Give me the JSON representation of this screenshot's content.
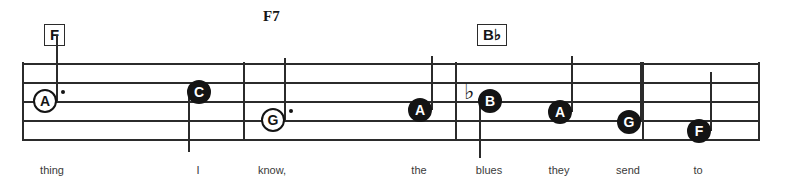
{
  "sheet": {
    "title": "music-notation-staff-excerpt",
    "colors": {
      "ink": "#2b2b2b",
      "note_fill": "#141414",
      "note_hollow": "#ffffff",
      "lyric": "#3a3a3a",
      "background": "#ffffff"
    }
  },
  "staff": {
    "line_count": 5,
    "line_ys": [
      63,
      82,
      101,
      120,
      139
    ],
    "left": 22,
    "right": 760
  },
  "barlines": [
    {
      "name": "barline-1",
      "x": 243
    },
    {
      "name": "barline-2",
      "x": 455
    },
    {
      "name": "barline-3",
      "x": 642
    }
  ],
  "staff_edges": [
    {
      "name": "staff-start",
      "x": 22
    },
    {
      "name": "staff-end",
      "x": 758
    }
  ],
  "chords": [
    {
      "label": "F",
      "boxed": true,
      "x": 44,
      "y": 24
    },
    {
      "label": "F7",
      "boxed": false,
      "x": 263,
      "y": 8
    },
    {
      "label": "B♭",
      "boxed": true,
      "x": 477,
      "y": 24
    }
  ],
  "notes": [
    {
      "letter": "A",
      "style": "hollow",
      "x": 45,
      "y": 101,
      "dotted": true,
      "accidental": "",
      "stem": "up",
      "stem_top": 35,
      "stem_bottom": 101
    },
    {
      "letter": "C",
      "style": "filled",
      "x": 199,
      "y": 92,
      "dotted": false,
      "accidental": "",
      "stem": "down",
      "stem_top": 92,
      "stem_bottom": 152
    },
    {
      "letter": "G",
      "style": "hollow",
      "x": 273,
      "y": 120,
      "dotted": true,
      "accidental": "",
      "stem": "up",
      "stem_top": 58,
      "stem_bottom": 120
    },
    {
      "letter": "A",
      "style": "filled",
      "x": 420,
      "y": 110,
      "dotted": false,
      "accidental": "",
      "stem": "up",
      "stem_top": 56,
      "stem_bottom": 110
    },
    {
      "letter": "B",
      "style": "filled",
      "x": 490,
      "y": 101,
      "dotted": false,
      "accidental": "♭",
      "stem": "down",
      "stem_top": 101,
      "stem_bottom": 158
    },
    {
      "letter": "A",
      "style": "filled",
      "x": 560,
      "y": 112,
      "dotted": false,
      "accidental": "",
      "stem": "up",
      "stem_top": 56,
      "stem_bottom": 112
    },
    {
      "letter": "G",
      "style": "filled",
      "x": 629,
      "y": 122,
      "dotted": false,
      "accidental": "",
      "stem": "up",
      "stem_top": 62,
      "stem_bottom": 122
    },
    {
      "letter": "F",
      "style": "filled",
      "x": 699,
      "y": 131,
      "dotted": false,
      "accidental": "",
      "stem": "up",
      "stem_top": 72,
      "stem_bottom": 131
    }
  ],
  "lyrics": [
    {
      "text": "thing",
      "x": 52,
      "y": 164
    },
    {
      "text": "I",
      "x": 198,
      "y": 164
    },
    {
      "text": "know,",
      "x": 272,
      "y": 164
    },
    {
      "text": "the",
      "x": 419,
      "y": 164
    },
    {
      "text": "blues",
      "x": 489,
      "y": 164
    },
    {
      "text": "they",
      "x": 559,
      "y": 164
    },
    {
      "text": "send",
      "x": 628,
      "y": 164
    },
    {
      "text": "to",
      "x": 698,
      "y": 164
    }
  ]
}
